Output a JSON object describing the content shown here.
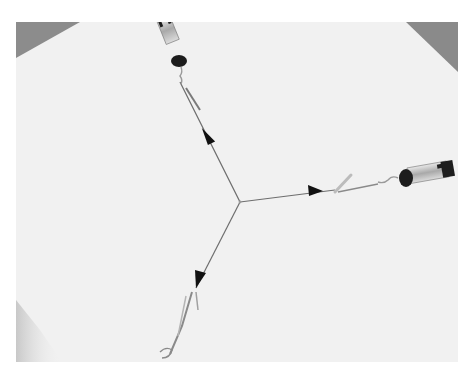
{
  "image": {
    "description": "Grayscale photograph of a force-equilibrium experiment: three spring scales pulling strings that meet at a single knot on white paper; each string has a drawn arrowhead indicating force direction.",
    "frame": {
      "x": 16,
      "y": 22,
      "width": 442,
      "height": 340
    },
    "colors": {
      "paper": "#f1f1f1",
      "table_corner": "#8a8a8a",
      "string": "#6a6a6a",
      "arrowhead": "#111111",
      "scale_dark": "#1e1e1e",
      "scale_metal": "#bdbdbd"
    },
    "junction": {
      "x": 240,
      "y": 202
    },
    "forces": [
      {
        "name": "upper-left",
        "end": {
          "x": 180,
          "y": 85
        },
        "arrow": {
          "x": 210,
          "y": 135
        }
      },
      {
        "name": "right",
        "end": {
          "x": 335,
          "y": 190
        },
        "arrow": {
          "x": 318,
          "y": 192
        }
      },
      {
        "name": "lower-left",
        "end": {
          "x": 190,
          "y": 295
        },
        "arrow": {
          "x": 202,
          "y": 278
        }
      }
    ]
  }
}
